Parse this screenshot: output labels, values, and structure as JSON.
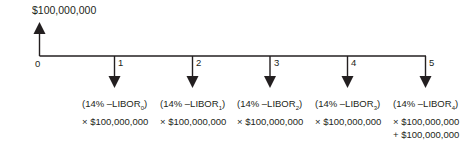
{
  "diagram": {
    "type": "cash-flow-timeline",
    "inflow": {
      "period": 0,
      "label": "$100,000,000",
      "direction": "up"
    },
    "periods": [
      "0",
      "1",
      "2",
      "3",
      "4",
      "5"
    ],
    "outflows": [
      {
        "period": 1,
        "rate": "(14% –LIBOR",
        "sub": "0",
        "close": ")",
        "lines": [
          "× $100,000,000"
        ]
      },
      {
        "period": 2,
        "rate": "(14% –LIBOR",
        "sub": "1",
        "close": ")",
        "lines": [
          "× $100,000,000"
        ]
      },
      {
        "period": 3,
        "rate": "(14% –LIBOR",
        "sub": "2",
        "close": ")",
        "lines": [
          "× $100,000,000"
        ]
      },
      {
        "period": 4,
        "rate": "(14% –LIBOR",
        "sub": "3",
        "close": ")",
        "lines": [
          "× $100,000,000"
        ]
      },
      {
        "period": 5,
        "rate": "(14% –LIBOR",
        "sub": "4",
        "close": ")",
        "lines": [
          "× $100,000,000",
          "+ $100,000,000"
        ]
      }
    ],
    "colors": {
      "line": "#231f20",
      "text": "#231f20"
    }
  }
}
